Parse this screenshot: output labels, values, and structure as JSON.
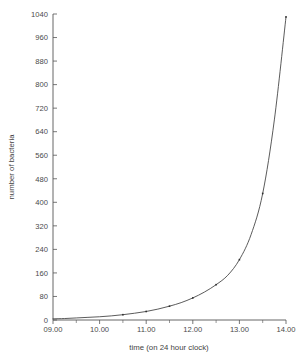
{
  "chart_data": {
    "type": "line",
    "title": "",
    "xlabel": "time (on 24 hour clock)",
    "ylabel": "number of bacteria",
    "grid": false,
    "legend": "none",
    "xlim": [
      9,
      14
    ],
    "ylim": [
      0,
      1040
    ],
    "x_tick_labels": [
      "09.00",
      "10.00",
      "11.00",
      "12.00",
      "13.00",
      "14.00"
    ],
    "x_tick_values": [
      9,
      10,
      11,
      12,
      13,
      14
    ],
    "x_minor_tick_values": [
      9.5,
      10.5,
      11.5,
      12.5,
      13.5
    ],
    "y_tick_labels": [
      "0",
      "80",
      "160",
      "240",
      "320",
      "400",
      "480",
      "560",
      "640",
      "720",
      "800",
      "880",
      "960",
      "1040"
    ],
    "y_tick_values": [
      0,
      80,
      160,
      240,
      320,
      400,
      480,
      560,
      640,
      720,
      800,
      880,
      960,
      1040
    ],
    "series": [
      {
        "name": "bacteria",
        "x": [
          9,
          9.25,
          9.5,
          9.75,
          10,
          10.25,
          10.5,
          10.75,
          11,
          11.25,
          11.5,
          11.75,
          12,
          12.25,
          12.5,
          12.75,
          13,
          13.25,
          13.5,
          13.75,
          14
        ],
        "values": [
          4,
          5,
          7,
          9,
          11,
          14,
          18,
          23,
          29,
          37,
          47,
          59,
          75,
          95,
          120,
          152,
          205,
          290,
          430,
          680,
          1030
        ]
      }
    ],
    "marker_points": {
      "x": [
        10.5,
        11,
        11.5,
        12,
        12.5,
        13,
        13.5,
        14
      ],
      "values": [
        18,
        29,
        47,
        75,
        120,
        205,
        430,
        1030
      ]
    },
    "colors": {
      "curve": "#3d3d3d",
      "axis": "#555555",
      "text": "#4a4a4a",
      "background": "#ffffff"
    }
  }
}
